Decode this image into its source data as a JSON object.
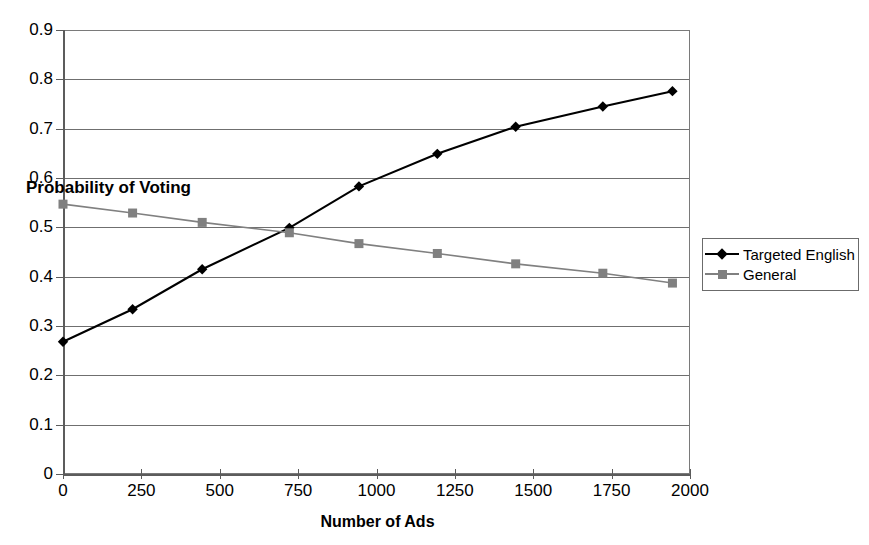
{
  "chart_data": {
    "type": "line",
    "title": "",
    "xlabel": "Number of Ads",
    "ylabel": "Probability of Voting",
    "xlim": [
      0,
      2000
    ],
    "ylim": [
      0,
      0.9
    ],
    "grid": true,
    "legend_position": "right",
    "x_ticks": [
      "0",
      "250",
      "500",
      "750",
      "1000",
      "1250",
      "1500",
      "1750",
      "2000"
    ],
    "x_tick_values": [
      0,
      250,
      500,
      750,
      1000,
      1250,
      1500,
      1750,
      2000
    ],
    "y_ticks": [
      "0",
      "0.1",
      "0.2",
      "0.3",
      "0.4",
      "0.5",
      "0.6",
      "0.7",
      "0.8",
      "0.9"
    ],
    "y_tick_values": [
      0,
      0.1,
      0.2,
      0.3,
      0.4,
      0.5,
      0.6,
      0.7,
      0.8,
      0.9
    ],
    "x": [
      0,
      222,
      444,
      722,
      944,
      1194,
      1444,
      1722,
      1944
    ],
    "series": [
      {
        "name": "Targeted English",
        "marker": "diamond",
        "color": "#000000",
        "values": [
          0.268,
          0.334,
          0.415,
          0.499,
          0.583,
          0.649,
          0.704,
          0.745,
          0.776
        ]
      },
      {
        "name": "General",
        "marker": "square",
        "color": "#808080",
        "values": [
          0.547,
          0.529,
          0.51,
          0.489,
          0.467,
          0.447,
          0.426,
          0.407,
          0.387
        ]
      }
    ]
  },
  "axis": {
    "y_title": "Probability of Voting",
    "x_title": "Number of Ads"
  },
  "legend": {
    "items": [
      {
        "label": "Targeted English"
      },
      {
        "label": "General"
      }
    ]
  }
}
